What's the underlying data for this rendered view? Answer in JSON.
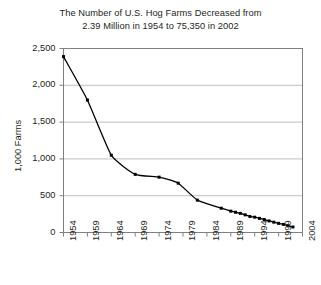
{
  "chart_data": {
    "type": "line",
    "title": "The Number of U.S. Hog Farms Decreased from 2.39 Million in 1954 to 75,350 in 2002",
    "title_lines": [
      "The Number of U.S. Hog Farms Decreased from",
      "2.39 Million in 1954 to 75,350 in 2002"
    ],
    "xlabel": "",
    "ylabel": "1,000 Farms",
    "xlim": [
      1954,
      2004
    ],
    "ylim": [
      0,
      2500
    ],
    "grid": true,
    "legend": false,
    "marker": "square",
    "line_color": "#000000",
    "grid_color": "#bfbfbf",
    "axis_color": "#808080",
    "x_tick_labels": [
      "1954",
      "1959",
      "1964",
      "1969",
      "1974",
      "1979",
      "1984",
      "1989",
      "1994",
      "1999",
      "2004"
    ],
    "x_ticks": [
      1954,
      1959,
      1964,
      1969,
      1974,
      1979,
      1984,
      1989,
      1994,
      1999,
      2004
    ],
    "y_tick_labels": [
      "0",
      "500",
      "1,000",
      "1,500",
      "2,000",
      "2,500"
    ],
    "y_ticks": [
      0,
      500,
      1000,
      1500,
      2000,
      2500
    ],
    "series": [
      {
        "name": "U.S. Hog Farms",
        "x": [
          1954,
          1959,
          1964,
          1969,
          1974,
          1978,
          1982,
          1987,
          1989,
          1990,
          1991,
          1992,
          1993,
          1994,
          1995,
          1996,
          1997,
          1998,
          1999,
          2000,
          2001,
          2002
        ],
        "values": [
          2390,
          1800,
          1050,
          790,
          752,
          670,
          440,
          330,
          290,
          275,
          260,
          240,
          218,
          208,
          192,
          176,
          157,
          140,
          124,
          110,
          92,
          75
        ]
      }
    ]
  }
}
